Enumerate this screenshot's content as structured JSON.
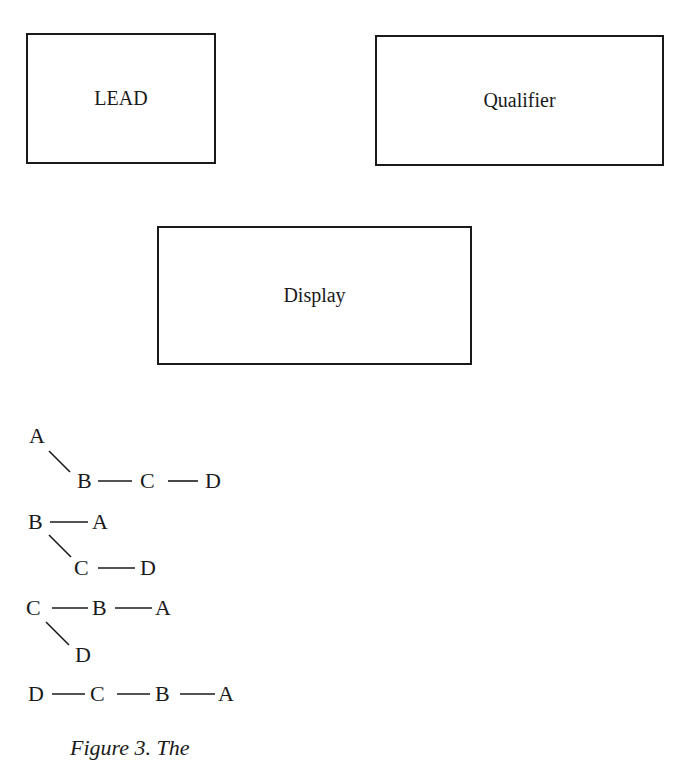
{
  "boxes": {
    "lead": "LEAD",
    "qualifier": "Qualifier",
    "display": "Display"
  },
  "trees": [
    {
      "nodes": [
        "A",
        "B",
        "C",
        "D"
      ],
      "edges": [
        "A\\B",
        "B—C",
        "C—D"
      ]
    },
    {
      "nodes": [
        "B",
        "A",
        "C",
        "D"
      ],
      "edges": [
        "B—A",
        "B\\C",
        "C—D"
      ]
    },
    {
      "nodes": [
        "C",
        "B",
        "A",
        "D"
      ],
      "edges": [
        "C—B",
        "B—A",
        "C\\D"
      ]
    },
    {
      "nodes": [
        "D",
        "C",
        "B",
        "A"
      ],
      "edges": [
        "D—C",
        "C—B",
        "B—A"
      ]
    }
  ],
  "caption": "Figure 3. The"
}
